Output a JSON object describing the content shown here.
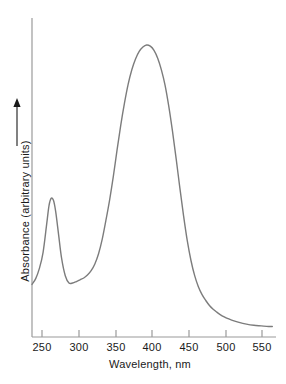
{
  "chart_data": {
    "type": "line",
    "title": "",
    "xlabel": "Wavelength, nm",
    "ylabel": "Absorbance (arbitrary units)",
    "ylabel_arrow": "upward-arrow",
    "xlim": [
      230,
      560
    ],
    "ylim": [
      0,
      1
    ],
    "grid": false,
    "legend": null,
    "xticks": [
      250,
      300,
      350,
      400,
      450,
      500,
      550
    ],
    "xtick_labels": [
      "250",
      "300",
      "350",
      "400",
      "450",
      "500",
      "550"
    ],
    "yticks": [],
    "ytick_labels": [],
    "line_color": "#7c7c7c",
    "axis_color": "#9a9a9a",
    "series": [
      {
        "name": "absorbance-spectrum",
        "x": [
          230,
          235,
          240,
          245,
          250,
          253,
          256,
          259,
          262,
          266,
          270,
          275,
          280,
          285,
          290,
          295,
          300,
          305,
          310,
          315,
          320,
          325,
          330,
          335,
          340,
          345,
          350,
          355,
          360,
          365,
          370,
          375,
          380,
          385,
          390,
          395,
          400,
          405,
          410,
          415,
          420,
          425,
          430,
          435,
          440,
          445,
          450,
          455,
          460,
          465,
          470,
          475,
          480,
          485,
          490,
          495,
          500,
          510,
          520,
          530,
          540,
          550,
          555
        ],
        "y": [
          0.18,
          0.2,
          0.235,
          0.29,
          0.39,
          0.45,
          0.475,
          0.468,
          0.43,
          0.35,
          0.27,
          0.21,
          0.185,
          0.185,
          0.19,
          0.196,
          0.202,
          0.212,
          0.227,
          0.25,
          0.285,
          0.335,
          0.4,
          0.47,
          0.55,
          0.64,
          0.725,
          0.8,
          0.865,
          0.915,
          0.952,
          0.978,
          0.993,
          1.0,
          0.996,
          0.982,
          0.955,
          0.915,
          0.862,
          0.79,
          0.705,
          0.61,
          0.51,
          0.415,
          0.33,
          0.262,
          0.21,
          0.172,
          0.145,
          0.125,
          0.108,
          0.095,
          0.085,
          0.076,
          0.069,
          0.063,
          0.058,
          0.05,
          0.044,
          0.04,
          0.038,
          0.036,
          0.036
        ]
      }
    ],
    "annotations": [
      {
        "name": "minor-peak",
        "x": 256,
        "y": 0.475,
        "label": ""
      },
      {
        "name": "local-minimum",
        "x": 282,
        "y": 0.184,
        "label": ""
      },
      {
        "name": "major-peak",
        "x": 385,
        "y": 1.0,
        "label": ""
      }
    ]
  }
}
